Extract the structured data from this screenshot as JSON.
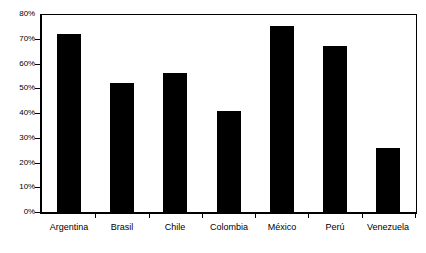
{
  "chart_data": {
    "type": "bar",
    "title": "",
    "subtitle": "",
    "xlabel": "",
    "ylabel": "",
    "categories": [
      "Argentina",
      "Brasil",
      "Chile",
      "Colombia",
      "México",
      "Perú",
      "Venezuela"
    ],
    "values": [
      72,
      52,
      56,
      41,
      75,
      67,
      26
    ],
    "value_unit": "%",
    "ylim": [
      0,
      80
    ],
    "ytick_values": [
      0,
      10,
      20,
      30,
      40,
      50,
      60,
      70,
      80
    ],
    "ytick_labels": [
      "0%",
      "10%",
      "20%",
      "30%",
      "40%",
      "50%",
      "60%",
      "70%",
      "80%"
    ],
    "grid": false,
    "legend": null,
    "legend_position": "none",
    "bar_color": "#000000",
    "plot_background": "#ffffff",
    "axis_color": "#000000",
    "annotations": []
  }
}
